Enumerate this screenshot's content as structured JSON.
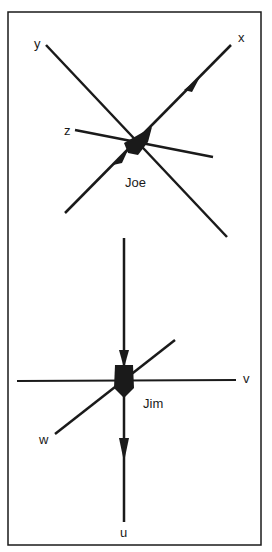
{
  "diagram": {
    "top": {
      "name": "Joe",
      "axes": [
        "x",
        "y",
        "z"
      ]
    },
    "bottom": {
      "name": "Jim",
      "axes": [
        "u",
        "v",
        "w"
      ]
    }
  },
  "colors": {
    "ink": "#1a1a1a",
    "background": "#ffffff"
  }
}
